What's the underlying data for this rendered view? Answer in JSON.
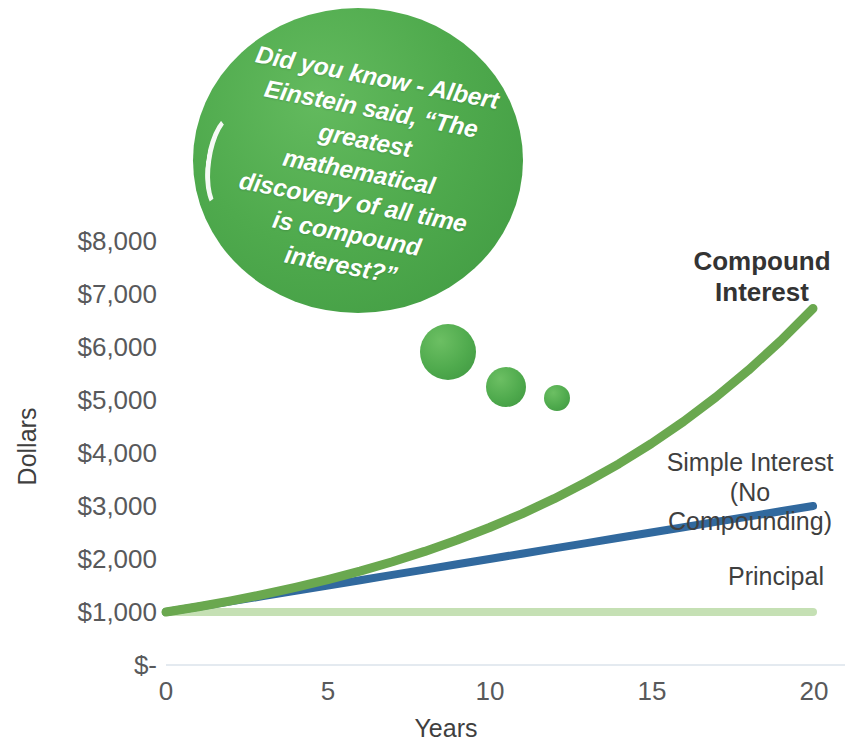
{
  "chart_data": {
    "type": "line",
    "title": "",
    "xlabel": "Years",
    "ylabel": "Dollars",
    "xlim": [
      0,
      20
    ],
    "ylim": [
      0,
      8000
    ],
    "grid": false,
    "legend_position": "inline-right",
    "x_ticks": [
      "0",
      "5",
      "10",
      "15",
      "20"
    ],
    "x_tick_values": [
      0,
      5,
      10,
      15,
      20
    ],
    "y_ticks": [
      "$-",
      "$1,000",
      "$2,000",
      "$3,000",
      "$4,000",
      "$5,000",
      "$6,000",
      "$7,000",
      "$8,000"
    ],
    "y_tick_values": [
      0,
      1000,
      2000,
      3000,
      4000,
      5000,
      6000,
      7000,
      8000
    ],
    "x": [
      0,
      1,
      2,
      3,
      4,
      5,
      6,
      7,
      8,
      9,
      10,
      11,
      12,
      13,
      14,
      15,
      16,
      17,
      18,
      19,
      20
    ],
    "series": [
      {
        "name": "Compound Interest",
        "color": "#6aa84f",
        "values": [
          1000,
          1100,
          1210,
          1331,
          1464,
          1611,
          1772,
          1949,
          2144,
          2358,
          2594,
          2853,
          3138,
          3452,
          3797,
          4177,
          4595,
          5054,
          5560,
          6116,
          6727
        ]
      },
      {
        "name": "Simple Interest (No Compounding)",
        "color": "#31699e",
        "values": [
          1000,
          1100,
          1200,
          1300,
          1400,
          1500,
          1600,
          1700,
          1800,
          1900,
          2000,
          2100,
          2200,
          2300,
          2400,
          2500,
          2600,
          2700,
          2800,
          2900,
          3000
        ]
      },
      {
        "name": "Principal",
        "color": "#c5e0b4",
        "values": [
          1000,
          1000,
          1000,
          1000,
          1000,
          1000,
          1000,
          1000,
          1000,
          1000,
          1000,
          1000,
          1000,
          1000,
          1000,
          1000,
          1000,
          1000,
          1000,
          1000,
          1000
        ]
      }
    ],
    "annotations": [
      {
        "name": "einstein-quote-bubble",
        "text": "Did you know - Albert Einstein said, “The greatest mathematical discovery of all time is compound interest?”"
      }
    ]
  },
  "axis": {
    "y_title": "Dollars",
    "x_title": "Years",
    "y_ticks": [
      "$8,000",
      "$7,000",
      "$6,000",
      "$5,000",
      "$4,000",
      "$3,000",
      "$2,000",
      "$1,000",
      "$-"
    ],
    "x_ticks": [
      "0",
      "5",
      "10",
      "15",
      "20"
    ]
  },
  "labels": {
    "compound": "Compound\nInterest",
    "simple": "Simple Interest\n(No Compounding)",
    "principal": "Principal"
  },
  "bubble": {
    "quote": "Did you know - Albert Einstein said, “The greatest mathematical discovery of all time is compound interest?”"
  },
  "colors": {
    "compound": "#6aa84f",
    "simple": "#31699e",
    "principal": "#c5e0b4",
    "bubble_green": "#4faa4d",
    "text_gray": "#58595b"
  }
}
